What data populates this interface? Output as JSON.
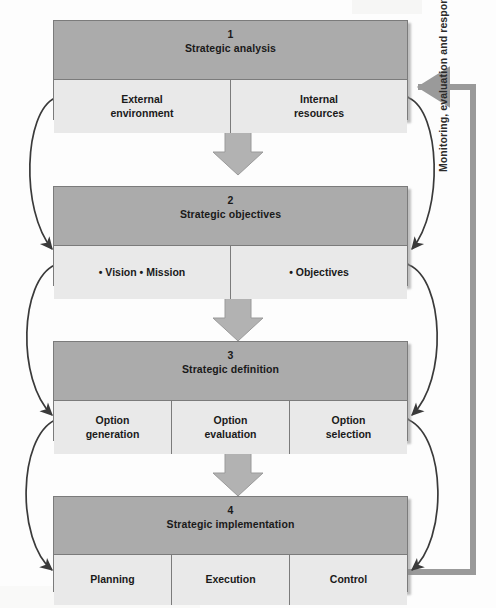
{
  "diagram": {
    "colors": {
      "header_fill": "#ababab",
      "body_fill": "#e9e9e9",
      "outline": "#7b7b7b",
      "arrow_gray": "#9a9a9a",
      "curve_stroke": "#3a3a3a",
      "background": "#fdfdfd"
    },
    "stages": [
      {
        "number": "1",
        "title": "Strategic analysis",
        "cells": [
          {
            "lines": [
              "External",
              "environment"
            ]
          },
          {
            "lines": [
              "Internal",
              "resources"
            ]
          }
        ]
      },
      {
        "number": "2",
        "title": "Strategic objectives",
        "cells": [
          {
            "bullets": [
              "Vision",
              "Mission"
            ]
          },
          {
            "bullets": [
              "Objectives"
            ]
          }
        ]
      },
      {
        "number": "3",
        "title": "Strategic definition",
        "cells": [
          {
            "lines": [
              "Option",
              "generation"
            ]
          },
          {
            "lines": [
              "Option",
              "evaluation"
            ]
          },
          {
            "lines": [
              "Option",
              "selection"
            ]
          }
        ]
      },
      {
        "number": "4",
        "title": "Strategic implementation",
        "cells": [
          {
            "lines": [
              "Planning"
            ]
          },
          {
            "lines": [
              "Execution"
            ]
          },
          {
            "lines": [
              "Control"
            ]
          }
        ]
      }
    ],
    "feedback_loop": {
      "label": "Monitoring, evaluation and response"
    },
    "bullet_glyph": "•"
  }
}
